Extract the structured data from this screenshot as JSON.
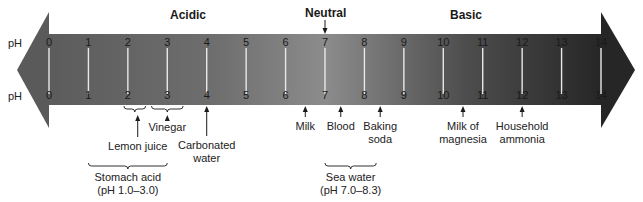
{
  "title_labels": {
    "acidic": "Acidic",
    "neutral": "Neutral",
    "basic": "Basic"
  },
  "axis_label": "pH",
  "scale": {
    "min": 0,
    "max": 14,
    "ticks": [
      "0",
      "1",
      "2",
      "3",
      "4",
      "5",
      "6",
      "7",
      "8",
      "9",
      "10",
      "11",
      "12",
      "13",
      "14"
    ]
  },
  "colors": {
    "acid_end": "#5a5a5a",
    "neutral_mid": "#8a8a8a",
    "base_end": "#2a2a2a",
    "tick_line": "#e8e8e8",
    "tick_text": "#1a1a1a",
    "arrow": "#1a1a1a"
  },
  "substances": [
    {
      "label_line1": "Lemon juice",
      "label_line2": "",
      "ph": 2.25
    },
    {
      "label_line1": "Vinegar",
      "label_line2": "",
      "ph": 3.0
    },
    {
      "label_line1": "Carbonated",
      "label_line2": "water",
      "ph": 4.0
    },
    {
      "label_line1": "Milk",
      "label_line2": "",
      "ph": 6.5
    },
    {
      "label_line1": "Blood",
      "label_line2": "",
      "ph": 7.4
    },
    {
      "label_line1": "Baking",
      "label_line2": "soda",
      "ph": 8.4
    },
    {
      "label_line1": "Milk of",
      "label_line2": "magnesia",
      "ph": 10.5
    },
    {
      "label_line1": "Household",
      "label_line2": "ammonia",
      "ph": 12.0
    }
  ],
  "ranges": [
    {
      "label_line1": "Stomach acid",
      "label_line2": "(pH 1.0–3.0)",
      "from": 1.0,
      "to": 3.0
    },
    {
      "label_line1": "Sea water",
      "label_line2": "(pH 7.0–8.3)",
      "from": 7.0,
      "to": 8.3
    }
  ],
  "small_brackets": [
    {
      "name": "lemon-juice",
      "from": 1.9,
      "to": 2.45
    },
    {
      "name": "vinegar",
      "from": 2.6,
      "to": 3.4
    }
  ]
}
